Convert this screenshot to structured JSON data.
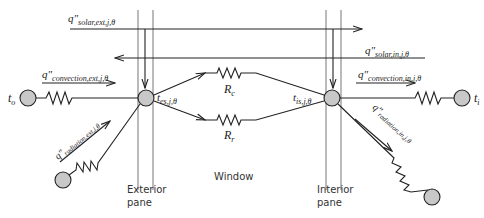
{
  "diagram": {
    "type": "thermal-resistance-network",
    "labels": {
      "q_solar_ext": {
        "base": "q″",
        "sub": "solar,ext,j,θ"
      },
      "q_solar_in": {
        "base": "q″",
        "sub": "solar,in,j,θ"
      },
      "q_conv_ext": {
        "base": "q″",
        "sub": "convection,ext,j,θ"
      },
      "q_conv_in": {
        "base": "q″",
        "sub": "convection,in,j,θ"
      },
      "q_rad_ext": {
        "base": "q″",
        "sub": "radiation,ext,j,θ"
      },
      "q_rad_in": {
        "base": "q″",
        "sub": "radiation,in,j,θ"
      },
      "t_o": {
        "base": "t",
        "sub": "o"
      },
      "t_i": {
        "base": "t",
        "sub": "i"
      },
      "t_es": {
        "base": "t",
        "sub": "es,j,θ"
      },
      "t_is": {
        "base": "t",
        "sub": "is,j,θ"
      },
      "R_c": {
        "base": "R",
        "sub": "c"
      },
      "R_r": {
        "base": "R",
        "sub": "r"
      }
    },
    "captions": {
      "exterior_pane": [
        "Exterior",
        "pane"
      ],
      "interior_pane": [
        "Interior",
        "pane"
      ],
      "window": "Window"
    },
    "colors": {
      "node_fill": "#c8c8c8",
      "line": "#222222",
      "pane": "#777777"
    }
  }
}
